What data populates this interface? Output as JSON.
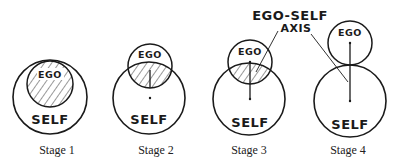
{
  "diagram": {
    "annotation": {
      "line1": "EGO-SELF",
      "line2": "AXIS"
    },
    "stages": [
      {
        "label": "Stage 1",
        "ego_text": "EGO",
        "self_text": "SELF",
        "relation": "ego fully contained within self (hatched)"
      },
      {
        "label": "Stage 2",
        "ego_text": "EGO",
        "self_text": "SELF",
        "relation": "ego largely overlapping self (hatched overlap)"
      },
      {
        "label": "Stage 3",
        "ego_text": "EGO",
        "self_text": "SELF",
        "relation": "ego partially overlapping self (small hatched overlap)"
      },
      {
        "label": "Stage 4",
        "ego_text": "EGO",
        "self_text": "SELF",
        "relation": "ego touching self, connected by axis"
      }
    ],
    "colors": {
      "ink": "#1a1a1a",
      "background": "#ffffff"
    }
  }
}
